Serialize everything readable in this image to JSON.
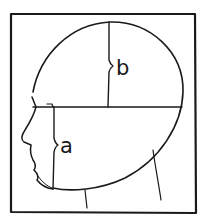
{
  "diagram": {
    "labels": {
      "a": "a",
      "b": "b"
    },
    "colors": {
      "line": "#1a1a1a",
      "background": "#ffffff"
    }
  }
}
